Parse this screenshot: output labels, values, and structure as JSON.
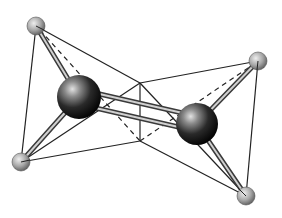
{
  "diagram": {
    "type": "molecular-structure",
    "colors": {
      "background": "#ffffff",
      "line": "#222222",
      "bond_outer": "#3a3a3a",
      "bond_inner": "#cfcfcf",
      "large_atom_dark": "#0a0a0a",
      "large_atom_light": "#d9d9d9",
      "small_atom_dark": "#555555",
      "small_atom_light": "#e6e6e6"
    },
    "atoms": [
      {
        "id": "M1",
        "kind": "large",
        "cx": 79,
        "cy": 97,
        "r": 22
      },
      {
        "id": "M2",
        "kind": "large",
        "cx": 197,
        "cy": 124,
        "r": 21
      },
      {
        "id": "L1",
        "kind": "small",
        "cx": 36,
        "cy": 26,
        "r": 9
      },
      {
        "id": "L2",
        "kind": "small",
        "cx": 258,
        "cy": 61,
        "r": 9
      },
      {
        "id": "L3",
        "kind": "small",
        "cx": 21,
        "cy": 162,
        "r": 9
      },
      {
        "id": "L4",
        "kind": "small",
        "cx": 246,
        "cy": 196,
        "r": 9
      }
    ],
    "vertices": {
      "center_top": {
        "x": 140,
        "y": 83
      },
      "center_bottom": {
        "x": 140,
        "y": 141
      }
    }
  }
}
